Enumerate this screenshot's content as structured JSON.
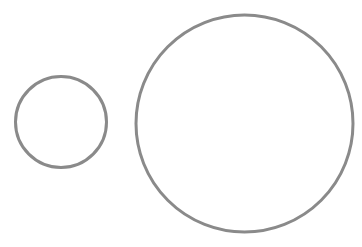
{
  "canvas": {
    "width": 362,
    "height": 247,
    "background": "#ffffff"
  },
  "circles": [
    {
      "name": "small-circle",
      "cx": 61,
      "cy": 122,
      "r": 45.5,
      "stroke": "#8a8a8a",
      "stroke_width": 3,
      "fill": "none"
    },
    {
      "name": "large-circle",
      "cx": 244.5,
      "cy": 123.5,
      "r": 108.5,
      "stroke": "#8a8a8a",
      "stroke_width": 3,
      "fill": "none"
    }
  ]
}
